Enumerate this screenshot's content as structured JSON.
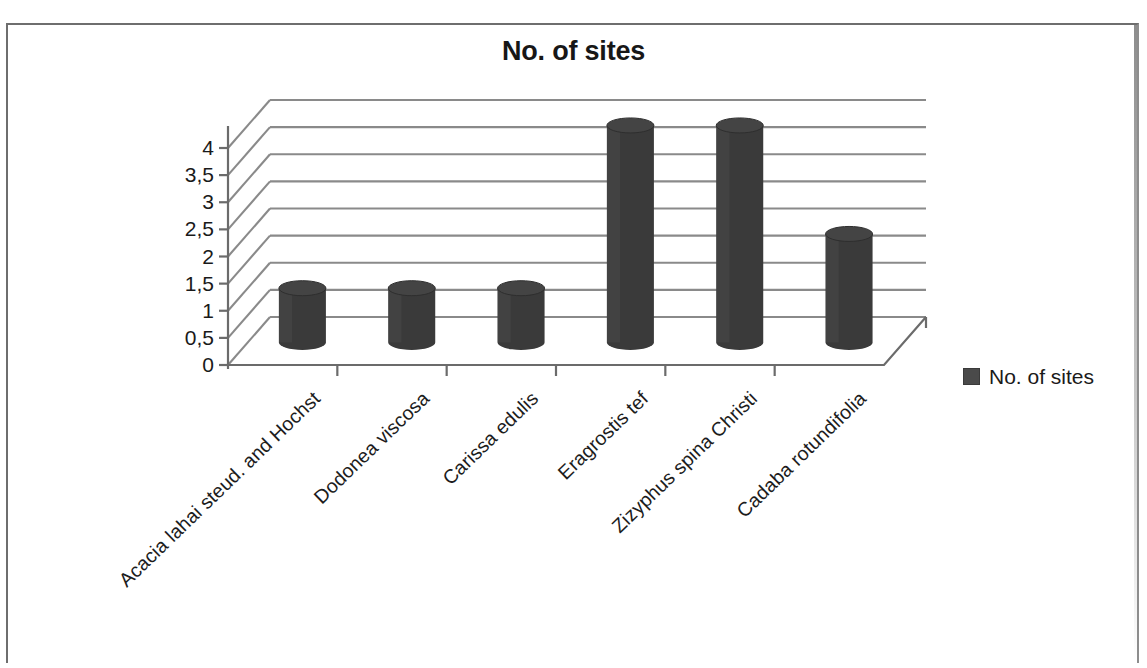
{
  "document": {
    "border_color": "#6e6e6e",
    "background": "#ffffff"
  },
  "chart_data": {
    "type": "bar",
    "title": "No. of sites",
    "subtitle": "",
    "xlabel": "",
    "ylabel": "",
    "categories": [
      "Acacia lahai steud. and Hochst",
      "Dodonea viscosa",
      "Carissa edulis",
      "Eragrostis tef",
      "Zizyphus spina Christi",
      "Cadaba rotundifolia"
    ],
    "values": [
      1,
      1,
      1,
      4,
      4,
      2
    ],
    "series": [
      {
        "name": "No. of sites",
        "values": [
          1,
          1,
          1,
          4,
          4,
          2
        ],
        "color": "#3a3a3a"
      }
    ],
    "ylim": [
      0,
      4
    ],
    "ytick_step": 0.5,
    "ytick_labels": [
      "0",
      "0,5",
      "1",
      "1,5",
      "2",
      "2,5",
      "3",
      "3,5",
      "4"
    ],
    "ytick_values": [
      0,
      0.5,
      1,
      1.5,
      2,
      2.5,
      3,
      3.5,
      4
    ],
    "grid": true,
    "grid_color": "#8a8a8a",
    "style": "3d-cylinder",
    "legend_position": "right",
    "legend": [
      {
        "label": "No. of sites",
        "color": "#4a4a4a"
      }
    ],
    "xlabel_rotation": -44,
    "bar_color": "#3a3a3a",
    "axis_color": "#6b6b6b"
  },
  "legend": {
    "label": "No. of sites",
    "swatch_color": "#4a4a4a"
  },
  "axes": {
    "y_labels": [
      "4",
      "3,5",
      "3",
      "2,5",
      "2",
      "1,5",
      "1",
      "0,5",
      "0"
    ]
  }
}
